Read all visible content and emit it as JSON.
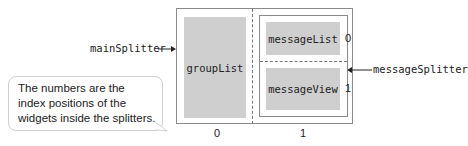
{
  "diagram": {
    "main_splitter_label": "mainSplitter",
    "message_splitter_label": "messageSplitter",
    "widgets": {
      "group_list": "groupList",
      "message_list": "messageList",
      "message_view": "messageView"
    },
    "main_indices": [
      "0",
      "1"
    ],
    "message_indices": [
      "0",
      "1"
    ],
    "callout_lines": [
      "The numbers are the",
      "index positions of the",
      "widgets inside the splitters."
    ],
    "colors": {
      "widget_fill": "#cfcfcf",
      "border": "#8a8a8a",
      "callout_border": "#cfcfcf"
    }
  }
}
